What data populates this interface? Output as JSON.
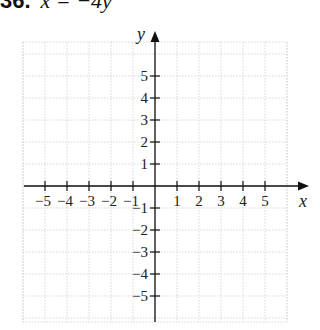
{
  "problem": {
    "number": "36.",
    "equation": "x = −4y"
  },
  "chart_data": {
    "type": "line",
    "xlabel": "x",
    "ylabel": "y",
    "xlim": [
      -6,
      6
    ],
    "ylim": [
      -6,
      6
    ],
    "grid": true,
    "x_ticks": [
      -5,
      -4,
      -3,
      -2,
      -1,
      1,
      2,
      3,
      4,
      5
    ],
    "y_ticks": [
      -5,
      -4,
      -3,
      -2,
      -1,
      1,
      2,
      3,
      4,
      5
    ],
    "x_tick_labels": [
      "−5",
      "−4",
      "−3",
      "−2",
      "−1",
      "1",
      "2",
      "3",
      "4",
      "5"
    ],
    "y_tick_labels": [
      "−5",
      "−4",
      "−3",
      "−2",
      "−1",
      "1",
      "2",
      "3",
      "4",
      "5"
    ],
    "series": []
  },
  "colors": {
    "axis": "#111111",
    "grid": "#d8d8d8"
  }
}
